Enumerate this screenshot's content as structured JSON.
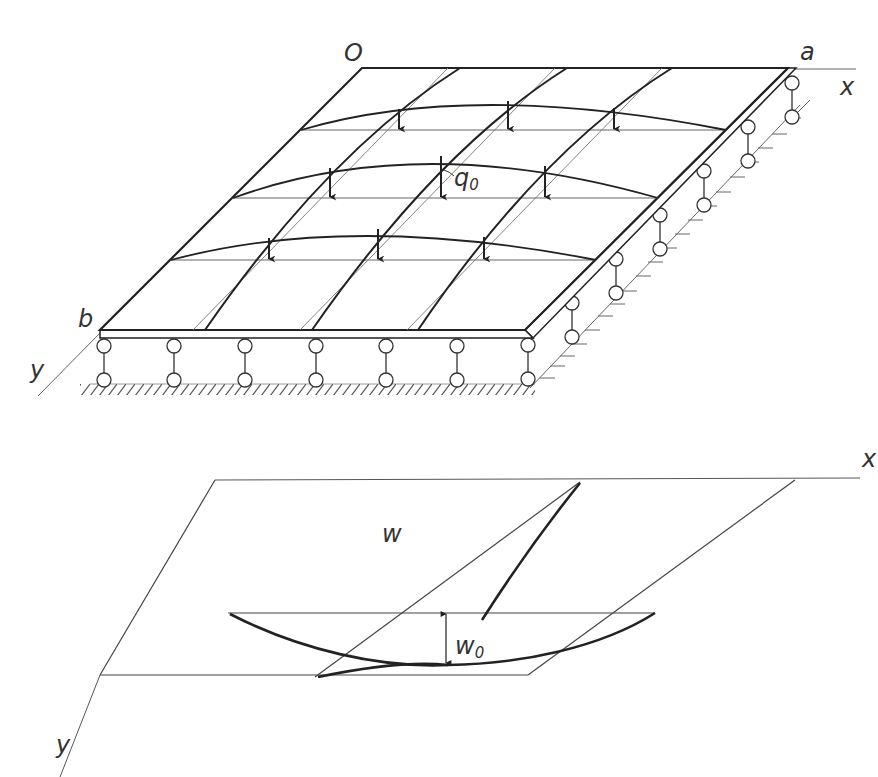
{
  "figure": {
    "top_panel": {
      "description": "Rectangular plate simply supported on all edges (roller/pendulum supports), under distributed load q0",
      "labels": {
        "origin": "O",
        "corner_a": "a",
        "corner_b": "b",
        "x_axis": "x",
        "y_axis": "y",
        "load_main": "q",
        "load_sub": "0"
      },
      "load_rows": 3,
      "arrows_per_row": 3,
      "supports_front_edge": 7,
      "supports_right_edge": 6
    },
    "bottom_panel": {
      "description": "Deflected surface of the plate, showing maximum deflection w0 at the center",
      "labels": {
        "deflection": "w",
        "x_axis": "x",
        "y_axis": "y",
        "max_deflection_main": "w",
        "max_deflection_sub": "0"
      }
    },
    "colors": {
      "line": "#2b2b2b",
      "thin_line": "#555555",
      "background": "#ffffff"
    }
  }
}
